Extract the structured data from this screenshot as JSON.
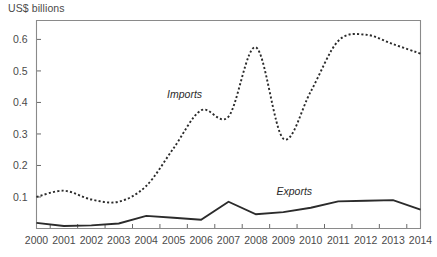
{
  "chart_data": {
    "type": "line",
    "title": "",
    "ylabel": "US$ billions",
    "xlabel": "",
    "x": [
      2000,
      2001,
      2002,
      2003,
      2004,
      2005,
      2006,
      2007,
      2008,
      2009,
      2010,
      2011,
      2012,
      2013,
      2014
    ],
    "categories": [
      "2000",
      "2001",
      "2002",
      "2003",
      "2004",
      "2005",
      "2006",
      "2007",
      "2008",
      "2009",
      "2010",
      "2011",
      "2012",
      "2013",
      "2014"
    ],
    "series": [
      {
        "name": "Imports",
        "style": "dotted",
        "color": "#2b2b2b",
        "values": [
          0.1,
          0.12,
          0.092,
          0.085,
          0.135,
          0.255,
          0.375,
          0.355,
          0.575,
          0.285,
          0.435,
          0.595,
          0.615,
          0.585,
          0.555
        ]
      },
      {
        "name": "Exports",
        "style": "solid",
        "color": "#2b2b2b",
        "values": [
          0.018,
          0.008,
          0.01,
          0.016,
          0.04,
          0.034,
          0.028,
          0.085,
          0.045,
          0.052,
          0.066,
          0.086,
          0.088,
          0.09,
          0.06
        ]
      }
    ],
    "ylim": [
      0.0,
      0.66
    ],
    "yticks": [
      0.1,
      0.2,
      0.3,
      0.4,
      0.5,
      0.6
    ],
    "ytick_labels": [
      "0.1",
      "0.2",
      "0.3",
      "0.4",
      "0.5",
      "0.6"
    ],
    "xlim": [
      2000,
      2014
    ],
    "grid": false,
    "legend": "inline-annotations",
    "annotations": [
      {
        "text": "Imports",
        "x": 2005.4,
        "y": 0.415
      },
      {
        "text": "Exports",
        "x": 2009.4,
        "y": 0.105
      }
    ]
  },
  "labels": {
    "y_axis_title": "US$ billions",
    "imports": "Imports",
    "exports": "Exports"
  }
}
